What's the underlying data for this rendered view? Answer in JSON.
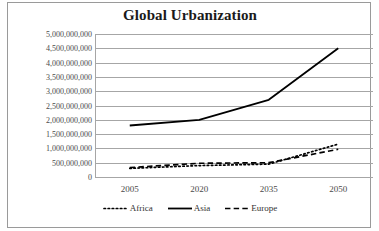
{
  "chart_data": {
    "type": "line",
    "title": "Global Urbanization",
    "xlabel": "",
    "ylabel": "",
    "x": [
      2005,
      2020,
      2035,
      2050
    ],
    "categories": [
      "2005",
      "2020",
      "2035",
      "2050"
    ],
    "series": [
      {
        "name": "Africa",
        "style": "dotted",
        "color": "#000000",
        "values": [
          300000000,
          400000000,
          450000000,
          1150000000
        ]
      },
      {
        "name": "Asia",
        "style": "solid",
        "color": "#000000",
        "values": [
          1800000000,
          2000000000,
          2700000000,
          4500000000
        ]
      },
      {
        "name": "Europe",
        "style": "dashed",
        "color": "#000000",
        "values": [
          330000000,
          480000000,
          500000000,
          970000000
        ]
      }
    ],
    "ylim": [
      0,
      5000000000
    ],
    "ytick_step": 500000000,
    "ytick_labels": [
      "5,000,000,000",
      "4,500,000,000",
      "4,000,000,000",
      "3,500,000,000",
      "3,000,000,000",
      "2,500,000,000",
      "2,000,000,000",
      "1,500,000,000",
      "1,000,000,000",
      "500,000,000",
      "0"
    ],
    "ytick_values": [
      5000000000,
      4500000000,
      4000000000,
      3500000000,
      3000000000,
      2500000000,
      2000000000,
      1500000000,
      1000000000,
      500000000,
      0
    ],
    "xtick_labels": [
      "2005",
      "2020",
      "2035",
      "2050"
    ],
    "grid": "horizontal",
    "legend_position": "bottom",
    "legend": [
      "Africa",
      "Asia",
      "Europe"
    ],
    "gridline_color": "#a6a6a6",
    "axis_color": "#a6a6a6",
    "text_color": "#4a4a4a",
    "title_color": "#1a1a1a",
    "background": "#ffffff",
    "border_color": "#9a9a9a"
  }
}
